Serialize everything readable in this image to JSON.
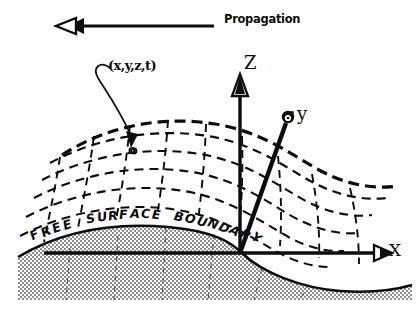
{
  "figure": {
    "background_color": "#ffffff",
    "ink_color": "#0d0d0d"
  },
  "propagation": {
    "label": "Propagation",
    "arrow_direction": "left",
    "arrow_icon": "left-arrow-icon",
    "shaft_start_x": 214,
    "shaft_end_x": 70,
    "shaft_y": 26
  },
  "point_annotation": {
    "label": "(x,y,z,t)",
    "marker_letter": "o",
    "marker_x": 134,
    "marker_y": 151,
    "leader_icon": "curved-leader-arrow-icon"
  },
  "axes": {
    "origin": {
      "x": 240,
      "y": 253
    },
    "items": [
      {
        "name": "z",
        "label": "Z",
        "tip_x": 240,
        "tip_y": 82,
        "arrow_style": "hollow-triangle"
      },
      {
        "name": "y",
        "label": "y",
        "tip_x": 289,
        "tip_y": 118,
        "arrow_style": "spiral-blob"
      },
      {
        "name": "x",
        "label": "X",
        "tip_x": 383,
        "tip_y": 253,
        "arrow_style": "hollow-triangle"
      }
    ]
  },
  "boundary": {
    "label": "FREE SURFACE BOUNDARY",
    "letters": [
      "F",
      "R",
      "E",
      "E",
      " ",
      "S",
      "U",
      "R",
      "F",
      "A",
      "C",
      "E",
      " ",
      "B",
      "O",
      "U",
      "N",
      "D",
      "A",
      "R",
      "Y"
    ],
    "description": "solid curved free-surface interface with stippled solid medium below"
  },
  "solid_medium": {
    "fill_pattern": "stipple-halftone",
    "fill_color": "#9a9a9a"
  },
  "wave_mesh": {
    "style": "dashed",
    "description": "curvilinear dashed mesh of wave crests and trough lines above the free surface",
    "crest_count": 6,
    "rib_count": 9
  },
  "chart_data": {
    "type": "line",
    "xlabel": "X",
    "ylabel": "Z",
    "series": [
      {
        "name": "crest-1",
        "amplitude": 26,
        "baseline_y": 140
      },
      {
        "name": "crest-2",
        "amplitude": 24,
        "baseline_y": 163
      },
      {
        "name": "crest-3",
        "amplitude": 22,
        "baseline_y": 186
      },
      {
        "name": "crest-4",
        "amplitude": 20,
        "baseline_y": 209
      },
      {
        "name": "crest-5",
        "amplitude": 18,
        "baseline_y": 232
      },
      {
        "name": "free-surface",
        "amplitude": 26,
        "baseline_y": 256
      }
    ]
  }
}
